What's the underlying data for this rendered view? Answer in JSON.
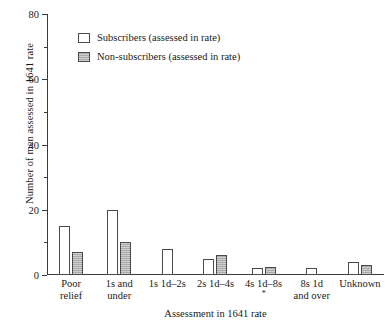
{
  "chart_data": {
    "type": "bar",
    "title": "",
    "xlabel": "Assessment in 1641 rate",
    "ylabel": "Number of men assessed in 1641 rate",
    "categories": [
      "Poor relief",
      "1s and under",
      "1s 1d–2s",
      "2s 1d–4s",
      "4s 1d–8s",
      "8s 1d and over",
      "Unknown"
    ],
    "series": [
      {
        "name": "Subscribers (assessed in rate)",
        "values": [
          15,
          20,
          8,
          5,
          2,
          2,
          4
        ]
      },
      {
        "name": "Non-subscribers (assessed in rate)",
        "values": [
          7,
          10,
          0,
          6,
          2.5,
          0,
          3
        ]
      }
    ],
    "ylim": [
      0,
      80
    ],
    "yticks": [
      0,
      20,
      40,
      60,
      80
    ],
    "yminorticks": [
      10,
      30,
      50,
      70
    ],
    "grid": false,
    "legend_position": "top-left",
    "annotations": [
      "*"
    ]
  },
  "axes": {
    "y_title": "Number of men assessed in 1641 rate",
    "x_title": "Assessment in 1641 rate",
    "y_tick_labels": [
      "0",
      "20",
      "40",
      "60",
      "80"
    ]
  },
  "categories": [
    {
      "line1": "Poor",
      "line2": "relief",
      "footnote": ""
    },
    {
      "line1": "1s and",
      "line2": "under",
      "footnote": ""
    },
    {
      "line1": "1s 1d–2s",
      "line2": "",
      "footnote": ""
    },
    {
      "line1": "2s 1d–4s",
      "line2": "",
      "footnote": ""
    },
    {
      "line1": "4s 1d–8s",
      "line2": "",
      "footnote": "*"
    },
    {
      "line1": "8s 1d",
      "line2": "and over",
      "footnote": ""
    },
    {
      "line1": "Unknown",
      "line2": "",
      "footnote": ""
    }
  ],
  "legend": {
    "items": [
      {
        "label": "Subscribers (assessed in rate)",
        "swatch": "white"
      },
      {
        "label": "Non-subscribers (assessed in rate)",
        "swatch": "gray"
      }
    ]
  },
  "colors": {
    "subscribers": "#ffffff",
    "non_subscribers": "#a9a9a9",
    "axis": "#3a3a3a",
    "outline": "#4a4a4a"
  }
}
